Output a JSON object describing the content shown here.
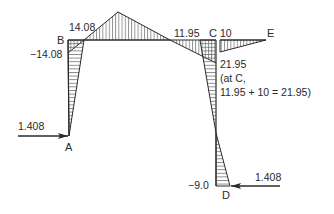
{
  "diagram": {
    "type": "bending-moment-diagram",
    "nodes": {
      "A": "A",
      "B": "B",
      "C": "C",
      "D": "D",
      "E": "E"
    },
    "values": {
      "B_beam": "14.08",
      "B_column": "−14.08",
      "C_beam": "11.95",
      "CE": "10",
      "C_column": "21.95",
      "note_line1": "(at C,",
      "note_line2": "11.95 + 10 = 21.95)",
      "D": "−9.0"
    },
    "loads": {
      "A_force": "1.408",
      "D_force": "1.408"
    },
    "colors": {
      "line": "#2a2a2a",
      "hatch": "#555555"
    }
  }
}
